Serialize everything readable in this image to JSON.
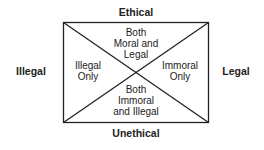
{
  "axes": {
    "top": "Ethical",
    "bottom": "Unethical",
    "left": "Illegal",
    "right": "Legal"
  },
  "regions": {
    "top": [
      "Both",
      "Moral and",
      "Legal"
    ],
    "left": [
      "Illegal",
      "Only"
    ],
    "right": [
      "Immoral",
      "Only"
    ],
    "bottom": [
      "Both",
      "Immoral",
      "and Illegal"
    ]
  },
  "colors": {
    "line": "#222222",
    "text": "#222222",
    "background": "#ffffff"
  }
}
